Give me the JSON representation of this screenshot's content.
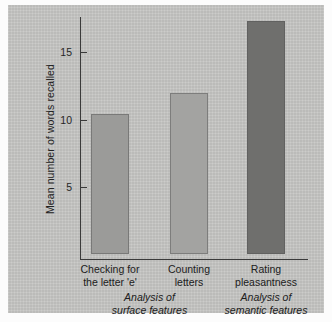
{
  "chart_data": {
    "type": "bar",
    "title": "",
    "xlabel": "",
    "ylabel": "Mean number of words recalled",
    "categories": [
      "Checking for\nthe letter 'e'",
      "Counting\nletters",
      "Rating\npleasantness"
    ],
    "values": [
      10.4,
      12.0,
      17.3
    ],
    "ylim": [
      0,
      18.5
    ],
    "yticks": [
      5,
      10,
      15
    ],
    "ytick_labels": [
      "5",
      "10",
      "15"
    ],
    "grid": false,
    "legend": "none",
    "bar_colors": [
      "#9b9b99",
      "#a3a3a1",
      "#6f6f6d"
    ],
    "group_labels": [
      "Analysis of\nsurface features",
      "Analysis of\nsemantic features"
    ],
    "annotations": []
  },
  "figure": {
    "background": "#c8c8c6",
    "axis_color": "#3a3a3a",
    "text_color": "#202020"
  }
}
